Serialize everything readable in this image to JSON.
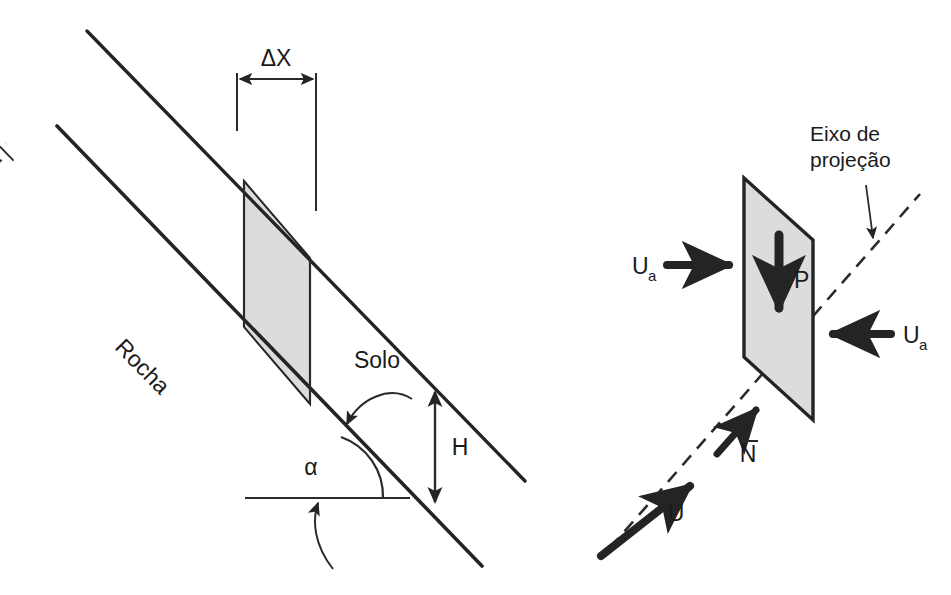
{
  "figure": {
    "background_color": "#ffffff",
    "line_color": "#242424",
    "fill_color": "#dcdcdc"
  },
  "left_panel": {
    "name": "Secao do talude",
    "labels": {
      "delta_x": "ΔX",
      "rocha": "Rocha",
      "solo": "Solo",
      "alpha": "α",
      "height": "H"
    },
    "elements": {
      "soil_surface_line": "linha de superficie do solo",
      "rock_interface_line": "linha de interface rocha-solo",
      "slice": "fatia sombreada de largura ΔX",
      "horizontal_reference": "linha horizontal de referencia",
      "angle_arc": "arco do angulo alfa",
      "dimension_arrows": "setas de cota"
    }
  },
  "right_panel": {
    "name": "Diagrama de forcas na fatia",
    "labels": {
      "axis_title_line1": "Eixo de",
      "axis_title_line2": "projeção",
      "weight": "P",
      "ua_left_base": "U",
      "ua_left_sub": "a",
      "ua_right_base": "U",
      "ua_right_sub": "a",
      "normal": "N",
      "normal_overbar": true,
      "u_force": "U"
    },
    "elements": {
      "slice_plane": "plano da fatia (paralelogramo sombreado)",
      "projection_axis": "eixo de projecao tracejado",
      "weight_arrow": "seta vertical do peso P",
      "ua_left_arrow": "seta Ua apontando para a direita",
      "ua_right_arrow": "seta Ua apontando para a esquerda",
      "n_arrow": "seta N normal",
      "u_arrow": "seta U resultante",
      "leader_arrow": "seta indicadora do eixo de projecao"
    }
  }
}
